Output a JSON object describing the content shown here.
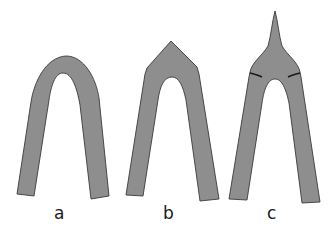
{
  "figure": {
    "fill_color": "#8e8e8e",
    "stroke_color": "#3a3a3a",
    "panels": [
      {
        "label": "a",
        "shape": "rounded-arch"
      },
      {
        "label": "b",
        "shape": "pointed-arch"
      },
      {
        "label": "c",
        "shape": "arch-with-spike-crest"
      }
    ]
  }
}
